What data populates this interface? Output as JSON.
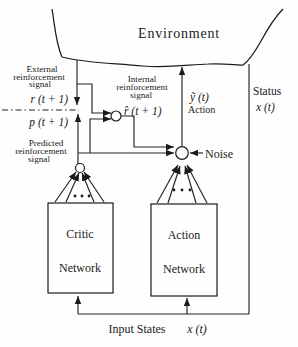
{
  "figure": {
    "environment_label": "Environment",
    "status": {
      "title": "Status",
      "symbol": "x (t)"
    },
    "external_signal": {
      "line1": "External",
      "line2": "reinforcement",
      "line3": "signal",
      "symbol": "r (t + 1)"
    },
    "predicted_signal": {
      "line1": "Predicted",
      "line2": "reinforcement",
      "line3": "signal",
      "symbol": "p (t + 1)"
    },
    "internal_signal": {
      "line1": "Internal",
      "line2": "reinforcement",
      "line3": "signal",
      "symbol": "r̂ (t + 1)"
    },
    "action_signal": {
      "symbol": "ỹ (t)",
      "caption": "Action"
    },
    "noise_label": "Noise",
    "critic_network": {
      "line1": "Critic",
      "line2": "Network"
    },
    "action_network": {
      "line1": "Action",
      "line2": "Network"
    },
    "input_states": {
      "title": "Input States",
      "symbol": "x (t)"
    },
    "colors": {
      "ink": "#1b1b1b",
      "background": "#fefefe"
    }
  }
}
